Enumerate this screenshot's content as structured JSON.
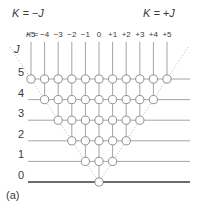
{
  "figure": {
    "panel_label": "(a)",
    "left_corner_label": "K = −J",
    "right_corner_label": "K = +J",
    "k_axis_label": "K =",
    "j_axis_label": "J",
    "line_color": "#9a9a9a",
    "baseline_color": "#6d6d6d",
    "node_stroke": "#8a8a8a",
    "node_fill": "#ffffff",
    "text_color": "#3a3a3a",
    "dotted_color": "#b5b5b5"
  },
  "chart_data": {
    "type": "scatter",
    "title": "",
    "subtitle": "",
    "xlabel": "K",
    "ylabel": "J",
    "grid": true,
    "legend_position": "none",
    "xlim": [
      -5.5,
      5.5
    ],
    "ylim": [
      0,
      5.6
    ],
    "x_tick_labels": [
      "−5",
      "−4",
      "−3",
      "−2",
      "−1",
      "0",
      "+1",
      "+2",
      "+3",
      "+4",
      "+5"
    ],
    "x_tick_values": [
      -5,
      -4,
      -3,
      -2,
      -1,
      0,
      1,
      2,
      3,
      4,
      5
    ],
    "y_tick_labels": [
      "5",
      "4",
      "3",
      "2",
      "1",
      "0"
    ],
    "y_tick_values": [
      5,
      4,
      3,
      2,
      1,
      0
    ],
    "annotations": [
      "K = −J",
      "K = +J",
      "(a)"
    ],
    "levels": [
      {
        "J": 5,
        "K": [
          -5,
          -4,
          -3,
          -2,
          -1,
          0,
          1,
          2,
          3,
          4,
          5
        ],
        "count": 11
      },
      {
        "J": 4,
        "K": [
          -4,
          -3,
          -2,
          -1,
          0,
          1,
          2,
          3,
          4
        ],
        "count": 9
      },
      {
        "J": 3,
        "K": [
          -3,
          -2,
          -1,
          0,
          1,
          2,
          3
        ],
        "count": 7
      },
      {
        "J": 2,
        "K": [
          -2,
          -1,
          0,
          1,
          2
        ],
        "count": 5
      },
      {
        "J": 1,
        "K": [
          -1,
          0,
          1
        ],
        "count": 3
      },
      {
        "J": 0,
        "K": [
          0
        ],
        "count": 1
      }
    ]
  }
}
